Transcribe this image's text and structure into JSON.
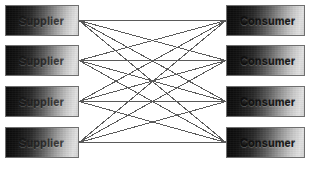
{
  "canvas": {
    "width": 309,
    "height": 176,
    "background": "#ffffff"
  },
  "style": {
    "edge_color": "#5a5a5a",
    "node_border_color": "#6f6f6f",
    "node_gradient_from": "#0a0a0a",
    "node_gradient_to": "#e2e2e2",
    "label_color": "#151515"
  },
  "diagram": {
    "type": "bipartite-graph",
    "left_column_label": "Supplier",
    "right_column_label": "Consumer"
  },
  "suppliers": [
    {
      "id": "supplier-1",
      "label": "Supplier",
      "x": 5,
      "y": 5,
      "w": 74,
      "h": 31
    },
    {
      "id": "supplier-2",
      "label": "Supplier",
      "x": 5,
      "y": 45,
      "w": 74,
      "h": 31
    },
    {
      "id": "supplier-3",
      "label": "Supplier",
      "x": 5,
      "y": 86,
      "w": 74,
      "h": 31
    },
    {
      "id": "supplier-4",
      "label": "Supplier",
      "x": 5,
      "y": 127,
      "w": 74,
      "h": 31
    }
  ],
  "consumers": [
    {
      "id": "consumer-1",
      "label": "Consumer",
      "x": 226,
      "y": 5,
      "w": 79,
      "h": 31
    },
    {
      "id": "consumer-2",
      "label": "Consumer",
      "x": 226,
      "y": 45,
      "w": 79,
      "h": 31
    },
    {
      "id": "consumer-3",
      "label": "Consumer",
      "x": 226,
      "y": 86,
      "w": 79,
      "h": 31
    },
    {
      "id": "consumer-4",
      "label": "Consumer",
      "x": 226,
      "y": 127,
      "w": 79,
      "h": 31
    }
  ],
  "edges": [
    {
      "from": "supplier-1",
      "to": "consumer-1"
    },
    {
      "from": "supplier-1",
      "to": "consumer-2"
    },
    {
      "from": "supplier-1",
      "to": "consumer-3"
    },
    {
      "from": "supplier-1",
      "to": "consumer-4"
    },
    {
      "from": "supplier-2",
      "to": "consumer-1"
    },
    {
      "from": "supplier-2",
      "to": "consumer-2"
    },
    {
      "from": "supplier-2",
      "to": "consumer-3"
    },
    {
      "from": "supplier-2",
      "to": "consumer-4"
    },
    {
      "from": "supplier-3",
      "to": "consumer-1"
    },
    {
      "from": "supplier-3",
      "to": "consumer-2"
    },
    {
      "from": "supplier-3",
      "to": "consumer-3"
    },
    {
      "from": "supplier-3",
      "to": "consumer-4"
    },
    {
      "from": "supplier-4",
      "to": "consumer-1"
    },
    {
      "from": "supplier-4",
      "to": "consumer-2"
    },
    {
      "from": "supplier-4",
      "to": "consumer-3"
    },
    {
      "from": "supplier-4",
      "to": "consumer-4"
    }
  ]
}
